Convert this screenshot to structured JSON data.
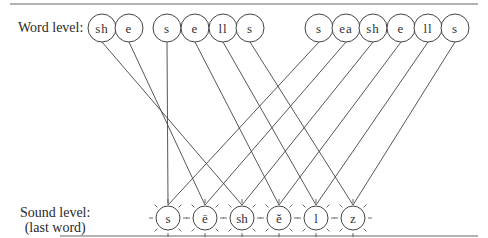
{
  "labels": {
    "word_level": "Word level:",
    "sound_level_line1": "Sound level:",
    "sound_level_line2": "(last word)"
  },
  "word_units": [
    {
      "text": "sh",
      "x": 102,
      "target": 2
    },
    {
      "text": "e",
      "x": 129,
      "target": 1
    },
    {
      "text": "s",
      "x": 167,
      "target": 0
    },
    {
      "text": "e",
      "x": 195,
      "target": 3
    },
    {
      "text": "ll",
      "x": 223,
      "target": 4
    },
    {
      "text": "s",
      "x": 250,
      "target": 5
    },
    {
      "text": "s",
      "x": 319,
      "target": 0
    },
    {
      "text": "ea",
      "x": 346,
      "target": 1
    },
    {
      "text": "sh",
      "x": 373,
      "target": 2
    },
    {
      "text": "e",
      "x": 401,
      "target": 3
    },
    {
      "text": "ll",
      "x": 428,
      "target": 4
    },
    {
      "text": "s",
      "x": 455,
      "target": 5
    }
  ],
  "sound_units": [
    {
      "text": "s",
      "x": 168
    },
    {
      "text": "ē",
      "x": 205
    },
    {
      "text": "sh",
      "x": 242
    },
    {
      "text": "ĕ",
      "x": 279
    },
    {
      "text": "l",
      "x": 316
    },
    {
      "text": "z",
      "x": 353
    }
  ],
  "colors": {
    "stroke": "#444444",
    "rule": "#888888"
  }
}
